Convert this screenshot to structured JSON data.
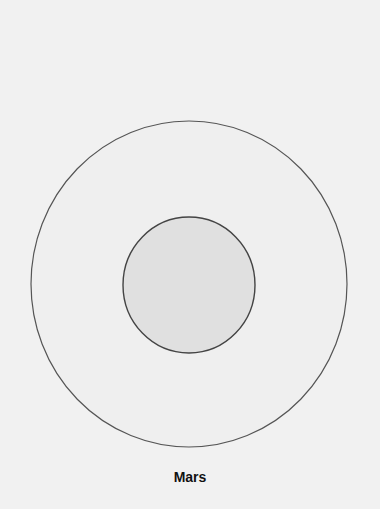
{
  "diagram": {
    "label": "Mars",
    "outer": {
      "cx": 189,
      "cy": 284,
      "rx": 158,
      "ry": 163,
      "fill": "#efefef",
      "stroke": "#555555"
    },
    "inner": {
      "cx": 189,
      "cy": 285,
      "rx": 66,
      "ry": 68,
      "fill": "#e0e0e0",
      "stroke": "#444444"
    },
    "background": "#f1f1f1"
  }
}
